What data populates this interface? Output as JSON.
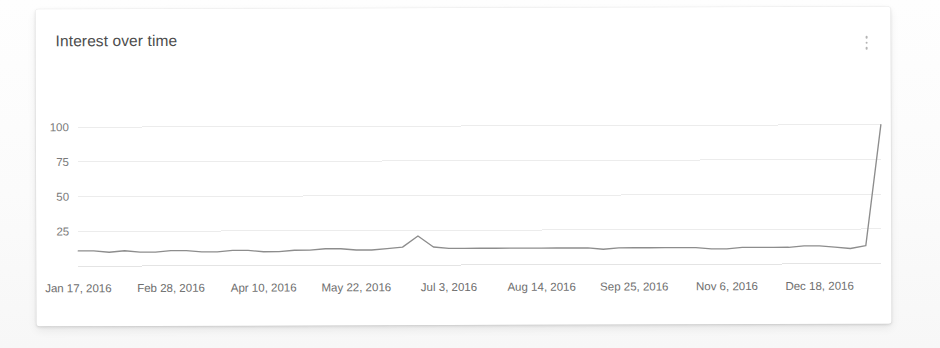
{
  "card": {
    "title": "Interest over time",
    "menu_icon": "kebab-menu-icon"
  },
  "chart_data": {
    "type": "line",
    "title": "Interest over time",
    "xlabel": "",
    "ylabel": "",
    "ylim": [
      0,
      100
    ],
    "yticks": [
      25,
      50,
      75,
      100
    ],
    "ytick_labels": [
      "25",
      "50",
      "75",
      "100"
    ],
    "grid": true,
    "legend": "none",
    "line_color": "#8d8d8d",
    "grid_color": "#ececec",
    "xtick_labels": [
      "Jan 17, 2016",
      "Feb 28, 2016",
      "Apr 10, 2016",
      "May 22, 2016",
      "Jul 3, 2016",
      "Aug 14, 2016",
      "Sep 25, 2016",
      "Nov 6, 2016",
      "Dec 18, 2016"
    ],
    "series": [
      {
        "name": "Interest",
        "values": [
          11,
          11,
          10,
          11,
          10,
          10,
          11,
          11,
          10,
          10,
          11,
          11,
          10,
          10,
          11,
          11,
          12,
          12,
          11,
          11,
          12,
          13,
          21,
          13,
          12,
          12,
          12,
          12,
          12,
          12,
          12,
          12,
          12,
          12,
          11,
          12,
          12,
          12,
          12,
          12,
          12,
          11,
          11,
          12,
          12,
          12,
          12,
          13,
          13,
          12,
          11,
          13,
          100
        ]
      }
    ],
    "annotations": [
      {
        "label": "minor bump",
        "x_label": "May 22, 2016",
        "value": 21
      },
      {
        "label": "terminal spike",
        "x_label": "Dec 25, 2016",
        "value": 100
      }
    ]
  }
}
